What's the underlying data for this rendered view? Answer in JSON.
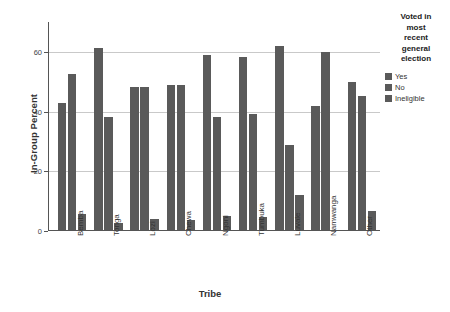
{
  "chart_data": {
    "type": "bar",
    "title": "",
    "xlabel": "Tribe",
    "ylabel": "In-Group Percent",
    "categories": [
      "Bemba",
      "Tonga",
      "Lozi",
      "Chewa",
      "Ngoni",
      "Tumbuka",
      "Luvale",
      "Namwanga",
      "Other"
    ],
    "series": [
      {
        "name": "Yes",
        "color": "#5a5a5a",
        "values": [
          42.4,
          60.9,
          47.8,
          48.5,
          58.6,
          58.0,
          61.5,
          41.7,
          49.5
        ]
      },
      {
        "name": "No",
        "color": "#5a5a5a",
        "values": [
          52.1,
          37.8,
          47.8,
          48.5,
          37.8,
          38.8,
          28.5,
          59.5,
          45.0
        ]
      },
      {
        "name": "Ineligible",
        "color": "#5a5a5a",
        "values": [
          5.5,
          2.4,
          3.6,
          3.4,
          4.6,
          4.4,
          11.8,
          0.0,
          6.3
        ]
      }
    ],
    "ylim": [
      0,
      70
    ],
    "yticks": [
      0,
      20,
      40,
      60
    ],
    "ytick_labels": [
      "0",
      "20",
      "40",
      "60"
    ],
    "grid": true,
    "legend_position": "right",
    "legend_title": "Voted in most recent general election",
    "legend_title_lines": [
      "Voted in",
      "most",
      "recent",
      "general",
      "election"
    ]
  }
}
